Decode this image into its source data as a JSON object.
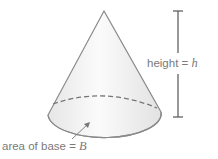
{
  "figure": {
    "shape": "cone",
    "labels": {
      "height": {
        "text": "height = ",
        "var": "h"
      },
      "base": {
        "text": "area of base = ",
        "var": "B"
      }
    },
    "colors": {
      "outline": "#8a8a8a",
      "fill_light": "#fafafa",
      "fill_shade": "#e4e4e4",
      "dashed": "#777777",
      "bracket": "#555555",
      "text": "#7a7a7a"
    }
  }
}
